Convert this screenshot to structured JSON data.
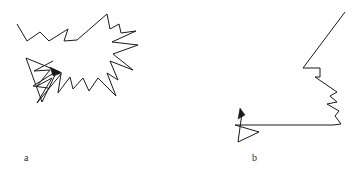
{
  "figure": {
    "width": 357,
    "height": 179,
    "background_color": "#ffffff",
    "stroke_color": "#1a1a1a",
    "stroke_width": 1
  },
  "chart_data": {
    "type": "line",
    "title": "",
    "xlabel": "",
    "ylabel": "",
    "grid": false,
    "legend_position": "none",
    "panels": [
      {
        "id": "a",
        "label": "a",
        "label_position": {
          "x": 24,
          "y": 153
        },
        "origin": {
          "x": 0,
          "y": 0
        },
        "strokes": [
          {
            "name": "jagged-outline",
            "closed": false,
            "points": [
              [
                17,
                24
              ],
              [
                27,
                41
              ],
              [
                40,
                32
              ],
              [
                49,
                41
              ],
              [
                68,
                29
              ],
              [
                64,
                41
              ],
              [
                77,
                40
              ],
              [
                107,
                14
              ],
              [
                110,
                29
              ],
              [
                119,
                24
              ],
              [
                121,
                33
              ],
              [
                136,
                31
              ],
              [
                112,
                42
              ],
              [
                138,
                45
              ],
              [
                113,
                54
              ],
              [
                133,
                70
              ],
              [
                110,
                61
              ],
              [
                118,
                80
              ],
              [
                107,
                73
              ],
              [
                116,
                96
              ],
              [
                98,
                78
              ],
              [
                89,
                91
              ],
              [
                83,
                78
              ],
              [
                73,
                89
              ],
              [
                70,
                77
              ],
              [
                58,
                93
              ],
              [
                61,
                74
              ],
              [
                37,
                103
              ],
              [
                52,
                78
              ],
              [
                37,
                86
              ],
              [
                50,
                70
              ],
              [
                34,
                71
              ],
              [
                53,
                61
              ]
            ]
          },
          {
            "name": "arrow-shaft-upper",
            "closed": false,
            "points": [
              [
                26,
                58
              ],
              [
                60,
                72
              ]
            ]
          },
          {
            "name": "arrow-lower-triangle",
            "closed": false,
            "points": [
              [
                26,
                58
              ],
              [
                42,
                102
              ],
              [
                57,
                71
              ],
              [
                33,
                86
              ],
              [
                48,
                88
              ]
            ]
          }
        ],
        "arrowheads": [
          {
            "name": "arrowhead-right",
            "tip": [
              62,
              73
            ],
            "polygon": [
              [
                62,
                73
              ],
              [
                50,
                67
              ],
              [
                53,
                76
              ]
            ]
          }
        ]
      },
      {
        "id": "b",
        "label": "b",
        "label_position": {
          "x": 252,
          "y": 153
        },
        "origin": {
          "x": 178,
          "y": 0
        },
        "strokes": [
          {
            "name": "jagged-outline",
            "closed": false,
            "points": [
              [
                345,
                12
              ],
              [
                303,
                68
              ],
              [
                320,
                68
              ],
              [
                320,
                77
              ],
              [
                315,
                77
              ],
              [
                337,
                92
              ],
              [
                330,
                96
              ],
              [
                337,
                102
              ],
              [
                327,
                104
              ],
              [
                339,
                111
              ],
              [
                335,
                116
              ],
              [
                341,
                124
              ],
              [
                333,
                125
              ],
              [
                235,
                125
              ]
            ]
          },
          {
            "name": "arrow-lower-triangle",
            "closed": false,
            "points": [
              [
                235,
                125
              ],
              [
                259,
                132
              ],
              [
                238,
                142
              ],
              [
                242,
                113
              ]
            ]
          }
        ],
        "arrowheads": [
          {
            "name": "arrowhead-up-left",
            "tip": [
              240,
              108
            ],
            "polygon": [
              [
                240,
                108
              ],
              [
                238,
                119
              ],
              [
                245,
                115
              ]
            ]
          }
        ]
      }
    ]
  },
  "labels": {
    "panel_a": "a",
    "panel_b": "b"
  }
}
